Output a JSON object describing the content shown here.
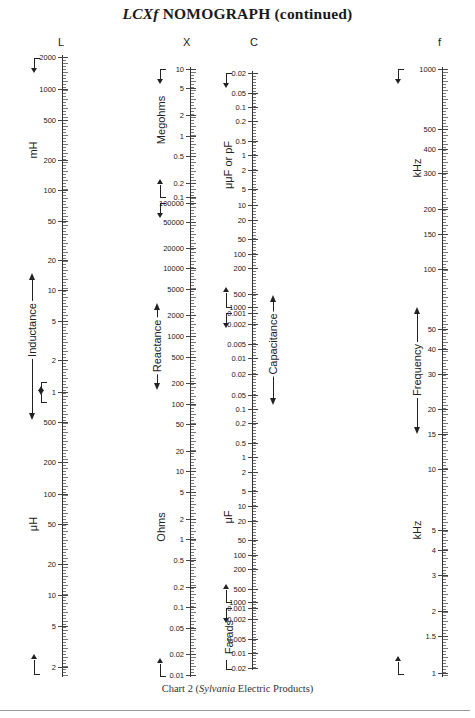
{
  "title": {
    "prefix": "LCXf",
    "text": "NOMOGRAPH (continued)"
  },
  "caption": {
    "prefix": "Chart 2 (",
    "italic": "Sylvania",
    "suffix": " Electric Products)"
  },
  "columns": [
    {
      "id": "L",
      "letter": "L",
      "axis_x": 62,
      "letter_x": 58,
      "ticks": [
        {
          "label": "2000",
          "y": 57
        },
        {
          "label": "1000",
          "y": 89
        },
        {
          "label": "500",
          "y": 120
        },
        {
          "label": "200",
          "y": 160
        },
        {
          "label": "100",
          "y": 190
        },
        {
          "label": "50",
          "y": 221
        },
        {
          "label": "20",
          "y": 260
        },
        {
          "label": "10",
          "y": 290
        },
        {
          "label": "5",
          "y": 321
        },
        {
          "label": "2",
          "y": 360
        },
        {
          "label": "1",
          "y": 392
        },
        {
          "label": "500",
          "y": 422
        },
        {
          "label": "200",
          "y": 462
        },
        {
          "label": "100",
          "y": 494
        },
        {
          "label": "50",
          "y": 524
        },
        {
          "label": "20",
          "y": 564
        },
        {
          "label": "10",
          "y": 595
        },
        {
          "label": "5",
          "y": 626
        },
        {
          "label": "2",
          "y": 667
        }
      ],
      "range": [
        55,
        677
      ],
      "units": [
        {
          "text": "mH",
          "x": 33,
          "y": 150
        },
        {
          "text": "μH",
          "x": 33,
          "y": 524
        }
      ],
      "quantity": {
        "text": "Inductance",
        "x": 32,
        "y": 330,
        "arrow_top": 273,
        "arrow_bottom": 420
      }
    },
    {
      "id": "X",
      "letter": "X",
      "axis_x": 190,
      "letter_x": 183,
      "ticks": [
        {
          "label": "10",
          "y": 69
        },
        {
          "label": "5",
          "y": 88
        },
        {
          "label": "2",
          "y": 115
        },
        {
          "label": "1",
          "y": 136
        },
        {
          "label": "0.5",
          "y": 156
        },
        {
          "label": "0.2",
          "y": 183
        },
        {
          "label": "0.1",
          "y": 197
        },
        {
          "label": "100000",
          "y": 203
        },
        {
          "label": "50000",
          "y": 222
        },
        {
          "label": "20000",
          "y": 248
        },
        {
          "label": "10000",
          "y": 268
        },
        {
          "label": "5000",
          "y": 289
        },
        {
          "label": "2000",
          "y": 315
        },
        {
          "label": "1000",
          "y": 336
        },
        {
          "label": "500",
          "y": 357
        },
        {
          "label": "200",
          "y": 383
        },
        {
          "label": "100",
          "y": 404
        },
        {
          "label": "50",
          "y": 424
        },
        {
          "label": "20",
          "y": 451
        },
        {
          "label": "10",
          "y": 471
        },
        {
          "label": "5",
          "y": 492
        },
        {
          "label": "2",
          "y": 519
        },
        {
          "label": "1",
          "y": 539
        },
        {
          "label": "0.5",
          "y": 560
        },
        {
          "label": "0.2",
          "y": 587
        },
        {
          "label": "0.1",
          "y": 607
        },
        {
          "label": "0.05",
          "y": 628
        },
        {
          "label": "0.02",
          "y": 654
        },
        {
          "label": "0.01",
          "y": 675
        }
      ],
      "range": [
        67,
        677
      ],
      "units": [
        {
          "text": "Megohms",
          "x": 161,
          "y": 120
        },
        {
          "text": "Ohms",
          "x": 161,
          "y": 527
        }
      ],
      "quantity": {
        "text": "Reactance",
        "x": 157,
        "y": 346,
        "arrow_top": 303,
        "arrow_bottom": 390
      }
    },
    {
      "id": "C",
      "letter": "C",
      "axis_x": 252,
      "letter_x": 250,
      "ticks": [
        {
          "label": "0.02",
          "y": 73
        },
        {
          "label": "0.05",
          "y": 93
        },
        {
          "label": "0.1",
          "y": 107
        },
        {
          "label": "0.2",
          "y": 121
        },
        {
          "label": "0.5",
          "y": 141
        },
        {
          "label": "1",
          "y": 155
        },
        {
          "label": "2",
          "y": 170
        },
        {
          "label": "5",
          "y": 189
        },
        {
          "label": "10",
          "y": 205
        },
        {
          "label": "20",
          "y": 220
        },
        {
          "label": "50",
          "y": 239
        },
        {
          "label": "100",
          "y": 254
        },
        {
          "label": "200",
          "y": 268
        },
        {
          "label": "500",
          "y": 294
        },
        {
          "label": "1000",
          "y": 307
        },
        {
          "label": "0.001",
          "y": 313
        },
        {
          "label": "0.002",
          "y": 324
        },
        {
          "label": "0.005",
          "y": 344
        },
        {
          "label": "0.01",
          "y": 358
        },
        {
          "label": "0.02",
          "y": 374
        },
        {
          "label": "0.05",
          "y": 395
        },
        {
          "label": "0.1",
          "y": 409
        },
        {
          "label": "0.2",
          "y": 423
        },
        {
          "label": "0.5",
          "y": 443
        },
        {
          "label": "1",
          "y": 457
        },
        {
          "label": "2",
          "y": 472
        },
        {
          "label": "5",
          "y": 491
        },
        {
          "label": "10",
          "y": 506
        },
        {
          "label": "20",
          "y": 521
        },
        {
          "label": "50",
          "y": 540
        },
        {
          "label": "100",
          "y": 555
        },
        {
          "label": "200",
          "y": 569
        },
        {
          "label": "500",
          "y": 589
        },
        {
          "label": "1000",
          "y": 602
        },
        {
          "label": "0.001",
          "y": 608
        },
        {
          "label": "0.002",
          "y": 619
        },
        {
          "label": "0.005",
          "y": 639
        },
        {
          "label": "0.01",
          "y": 653
        },
        {
          "label": "0.02",
          "y": 668
        }
      ],
      "range": [
        71,
        670
      ],
      "units": [
        {
          "text": "μμF or pF",
          "x": 228,
          "y": 165
        },
        {
          "text": "μF",
          "x": 228,
          "y": 517
        },
        {
          "text": "Farads",
          "x": 229,
          "y": 637
        }
      ],
      "quantity": {
        "text": "Capacitance",
        "x": 273,
        "y": 344,
        "arrow_top": 295,
        "arrow_bottom": 405
      }
    },
    {
      "id": "f",
      "letter": "f",
      "axis_x": 442,
      "letter_x": 438,
      "ticks": [
        {
          "label": "1000",
          "y": 69
        },
        {
          "label": "500",
          "y": 129
        },
        {
          "label": "400",
          "y": 149
        },
        {
          "label": "300",
          "y": 173
        },
        {
          "label": "200",
          "y": 209
        },
        {
          "label": "150",
          "y": 234
        },
        {
          "label": "100",
          "y": 269
        },
        {
          "label": "50",
          "y": 329
        },
        {
          "label": "40",
          "y": 349
        },
        {
          "label": "30",
          "y": 374
        },
        {
          "label": "20",
          "y": 409
        },
        {
          "label": "15",
          "y": 434
        },
        {
          "label": "10",
          "y": 469
        },
        {
          "label": "5",
          "y": 530
        },
        {
          "label": "4",
          "y": 550
        },
        {
          "label": "3",
          "y": 575
        },
        {
          "label": "2",
          "y": 611
        },
        {
          "label": "1.5",
          "y": 636
        },
        {
          "label": "1",
          "y": 673
        }
      ],
      "range": [
        67,
        677
      ],
      "units": [
        {
          "text": "kHz",
          "x": 417,
          "y": 168
        },
        {
          "text": "kHz",
          "x": 417,
          "y": 530
        }
      ],
      "quantity": {
        "text": "Frequency",
        "x": 417,
        "y": 370,
        "arrow_top": 307,
        "arrow_bottom": 434
      }
    }
  ],
  "chart_data": {
    "type": "nomograph",
    "title": "LCXf NOMOGRAPH (continued)",
    "caption": "Chart 2 (Sylvania Electric Products)",
    "scales": [
      {
        "name": "L",
        "quantity": "Inductance",
        "scale": "log",
        "units": [
          "mH",
          "μH"
        ],
        "tick_labels": [
          "2000",
          "1000",
          "500",
          "200",
          "100",
          "50",
          "20",
          "10",
          "5",
          "2",
          "1 (mH)",
          "500",
          "200",
          "100",
          "50",
          "20",
          "10",
          "5",
          "2 (μH)"
        ],
        "range": "2000 mH to ~1.5 μH"
      },
      {
        "name": "X",
        "quantity": "Reactance",
        "scale": "log",
        "units": [
          "Megohms",
          "Ohms"
        ],
        "tick_labels": [
          "10",
          "5",
          "2",
          "1",
          "0.5",
          "0.2",
          "0.1 (MΩ)",
          "100000",
          "50000",
          "20000",
          "10000",
          "5000",
          "2000",
          "1000",
          "500",
          "200",
          "100",
          "50",
          "20",
          "10",
          "5",
          "2",
          "1",
          "0.5",
          "0.2",
          "0.1",
          "0.05",
          "0.02",
          "0.01 (Ω)"
        ],
        "range": "10 MΩ to 0.01 Ω"
      },
      {
        "name": "C",
        "quantity": "Capacitance",
        "scale": "log",
        "units": [
          "μμF or pF",
          "μF",
          "Farads"
        ],
        "tick_labels": [
          "0.02",
          "0.05",
          "0.1",
          "0.2",
          "0.5",
          "1",
          "2",
          "5",
          "10",
          "20",
          "50",
          "100",
          "200",
          "500",
          "1000 (pF)",
          "0.001",
          "0.002",
          "0.005",
          "0.01",
          "0.02",
          "0.05",
          "0.1",
          "0.2",
          "0.5",
          "1",
          "2",
          "5",
          "10",
          "20",
          "50",
          "100",
          "200",
          "500",
          "1000 (μF)",
          "0.001",
          "0.002",
          "0.005",
          "0.01",
          "0.02 (F)"
        ],
        "range": "0.02 pF to 0.02 F"
      },
      {
        "name": "f",
        "quantity": "Frequency",
        "scale": "log",
        "units": [
          "kHz"
        ],
        "tick_labels": [
          "1000",
          "500",
          "400",
          "300",
          "200",
          "150",
          "100",
          "50",
          "40",
          "30",
          "20",
          "15",
          "10",
          "5",
          "4",
          "3",
          "2",
          "1.5",
          "1"
        ],
        "range": "1000 kHz to 1 kHz"
      }
    ]
  }
}
